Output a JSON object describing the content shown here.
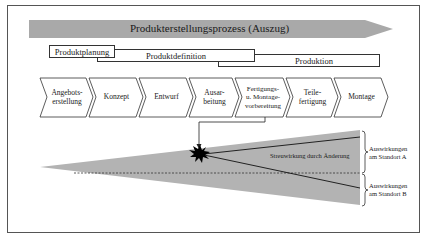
{
  "diagram": {
    "process_arrow": {
      "label": "Produkterstellungsprozess (Auszug)",
      "color": "#a9a9a9"
    },
    "phases": [
      {
        "label": "Produktplanung"
      },
      {
        "label": "Produktdefinition"
      },
      {
        "label": "Produktion"
      }
    ],
    "steps": [
      {
        "label": "Angebots-\nerstellung"
      },
      {
        "label": "Konzept"
      },
      {
        "label": "Entwurf"
      },
      {
        "label": "Ausar-\nbeitung"
      },
      {
        "label": "Fertigungs-\nu. Montage-\nvorbereitung"
      },
      {
        "label": "Teile-\nfertigung"
      },
      {
        "label": "Montage"
      }
    ],
    "spread": {
      "label": "Streuwirkung durch Änderung",
      "fill_color": "#b3b3b3",
      "impact_a": "Auswirkungen\nam Standort A",
      "impact_b": "Auswirkungen\nam Standort B"
    }
  }
}
